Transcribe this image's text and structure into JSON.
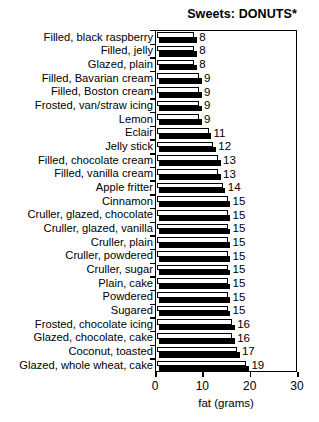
{
  "chart_data": {
    "type": "bar",
    "orientation": "horizontal",
    "title": "Sweets: DONUTS*",
    "xlabel": "fat (grams)",
    "ylabel": "",
    "xlim": [
      0,
      30
    ],
    "xticks": [
      0,
      10,
      20,
      30
    ],
    "xtick_labels": [
      "0",
      "10",
      "20",
      "30"
    ],
    "grid": false,
    "legend": null,
    "categories": [
      "Filled, black raspberry",
      "Filled, jelly",
      "Glazed, plain",
      "Filled, Bavarian cream",
      "Filled, Boston cream",
      "Frosted, van/straw icing",
      "Lemon",
      "Eclair",
      "Jelly stick",
      "Filled, chocolate cream",
      "Filled, vanilla cream",
      "Apple fritter",
      "Cinnamon",
      "Cruller, glazed, chocolate",
      "Cruller, glazed, vanilla",
      "Cruller, plain",
      "Cruller, powdered",
      "Cruller, sugar",
      "Plain, cake",
      "Powdered",
      "Sugared",
      "Frosted, chocolate icing",
      "Glazed, chocolate, cake",
      "Coconut, toasted",
      "Glazed, whole wheat, cake"
    ],
    "values": [
      8,
      8,
      8,
      9,
      9,
      9,
      9,
      11,
      12,
      13,
      13,
      14,
      15,
      15,
      15,
      15,
      15,
      15,
      15,
      15,
      15,
      16,
      16,
      17,
      19
    ],
    "value_labels": [
      "8",
      "8",
      "8",
      "9",
      "9",
      "9",
      "9",
      "11",
      "12",
      "13",
      "13",
      "14",
      "15",
      "15",
      "15",
      "15",
      "15",
      "15",
      "15",
      "15",
      "15",
      "16",
      "16",
      "17",
      "19"
    ],
    "colors": {
      "bar_face": "#ffffff",
      "bar_shadow": "#000000",
      "outline": "#000000",
      "background": "#ffffff",
      "text": "#000000"
    }
  }
}
